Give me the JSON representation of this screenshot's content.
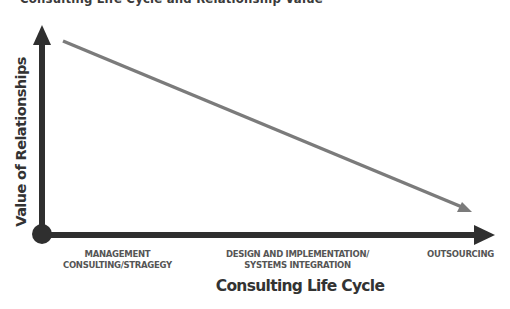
{
  "header": {
    "cutoff_text": "Consulting Life Cycle and Relationship Value"
  },
  "diagram": {
    "y_axis_label": "Value of Relationships",
    "x_axis_label": "Consulting Life Cycle",
    "x_ticks": [
      {
        "line1": "MANAGEMENT",
        "line2": "CONSULTING/STRAGEGY"
      },
      {
        "line1": "DESIGN AND IMPLEMENTATION/",
        "line2": "SYSTEMS INTEGRATION"
      },
      {
        "line1": "OUTSOURCING",
        "line2": ""
      }
    ],
    "colors": {
      "axes": "#2f2f2f",
      "trend_line": "#7b7b7b",
      "text": "#333333",
      "tick_text": "#555555"
    },
    "trend": "Value of relationships decreases across the consulting life cycle"
  }
}
